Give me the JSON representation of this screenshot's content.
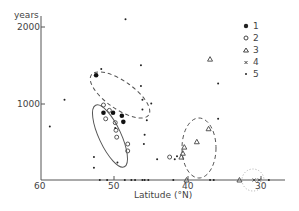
{
  "chart_data": {
    "type": "scatter",
    "title": "",
    "xlabel": "Latitude (°N)",
    "ylabel": "years",
    "x_reversed": true,
    "xlim": [
      60,
      28
    ],
    "ylim": [
      0,
      2200
    ],
    "x_ticks": [
      "60",
      "50",
      "40",
      "30"
    ],
    "y_ticks": [
      "1000",
      "2000"
    ],
    "grid": false,
    "legend_position": "upper right",
    "legend": [
      {
        "symbol": "filled-circle",
        "label": "1"
      },
      {
        "symbol": "open-circle",
        "label": "2"
      },
      {
        "symbol": "triangle",
        "label": "3"
      },
      {
        "symbol": "cross",
        "label": "4"
      },
      {
        "symbol": "small-dot",
        "label": "5"
      }
    ],
    "series": [
      {
        "name": "1",
        "symbol": "filled-circle",
        "points": [
          [
            52.5,
            1370
          ],
          [
            51.5,
            880
          ],
          [
            50.2,
            880
          ],
          [
            49.0,
            840
          ],
          [
            48.8,
            760
          ]
        ]
      },
      {
        "name": "2",
        "symbol": "open-circle",
        "points": [
          [
            51.5,
            980
          ],
          [
            50.7,
            910
          ],
          [
            51.2,
            800
          ],
          [
            49.9,
            750
          ],
          [
            49.8,
            650
          ],
          [
            49.7,
            560
          ],
          [
            48.2,
            470
          ],
          [
            48.2,
            380
          ],
          [
            42.5,
            300
          ]
        ]
      },
      {
        "name": "3",
        "symbol": "triangle",
        "points": [
          [
            37.0,
            1580
          ],
          [
            37.2,
            670
          ],
          [
            38.8,
            500
          ],
          [
            40.5,
            430
          ],
          [
            40.7,
            350
          ],
          [
            40.9,
            300
          ],
          [
            40.2,
            0
          ],
          [
            33.0,
            0
          ]
        ]
      },
      {
        "name": "4",
        "symbol": "cross",
        "points": [
          [
            31.0,
            0
          ],
          [
            30.3,
            0
          ]
        ]
      },
      {
        "name": "5",
        "symbol": "small-dot",
        "points": [
          [
            56.8,
            1050
          ],
          [
            58.8,
            700
          ],
          [
            48.5,
            2100
          ],
          [
            46.4,
            1500
          ],
          [
            46.4,
            1230
          ],
          [
            51.8,
            1450
          ],
          [
            49.9,
            680
          ],
          [
            45.9,
            590
          ],
          [
            46.0,
            470
          ],
          [
            52.8,
            300
          ],
          [
            52.8,
            160
          ],
          [
            49.6,
            230
          ],
          [
            44.2,
            270
          ],
          [
            41.8,
            270
          ],
          [
            41.5,
            310
          ],
          [
            35.9,
            1260
          ],
          [
            35.9,
            800
          ],
          [
            46.2,
            1050
          ],
          [
            46.2,
            920
          ],
          [
            45.6,
            780
          ],
          [
            45.0,
            1000
          ],
          [
            47.7,
            0
          ],
          [
            47.2,
            0
          ],
          [
            46.2,
            0
          ],
          [
            45.9,
            0
          ],
          [
            45.4,
            0
          ],
          [
            48.6,
            0
          ],
          [
            51.0,
            0
          ],
          [
            52.0,
            0
          ],
          [
            42.0,
            0
          ],
          [
            37.0,
            0
          ],
          [
            36.5,
            0
          ],
          [
            29.0,
            0
          ]
        ]
      }
    ],
    "annotations": [
      {
        "shape": "dashed-ellipse",
        "around": "series 1 high latitudes"
      },
      {
        "shape": "solid-ellipse",
        "around": "series 2 cluster"
      },
      {
        "shape": "dashed-ellipse",
        "around": "series 3 cluster ~40°N"
      },
      {
        "shape": "dotted-circle",
        "around": "series 4 ~30°N"
      }
    ]
  },
  "axis": {
    "y_title": "years",
    "y_tick_2000": "2000",
    "y_tick_1000": "1000",
    "x_tick_60": "60",
    "x_tick_50": "50",
    "x_tick_40": "40",
    "x_tick_30": "30",
    "x_title": "Latitude (°N)"
  },
  "legend": {
    "l1": "1",
    "l2": "2",
    "l3": "3",
    "l4": "4",
    "l5": "5"
  }
}
